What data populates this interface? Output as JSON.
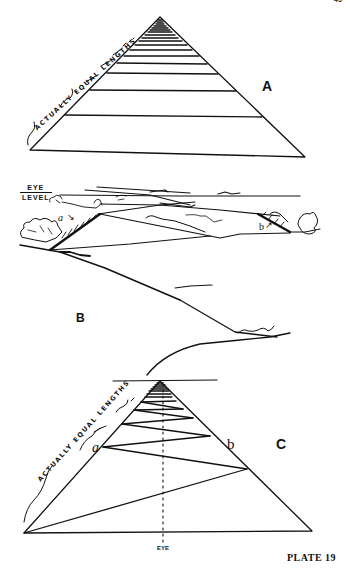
{
  "page": {
    "page_number": "43",
    "caption": "PLATE 19"
  },
  "figure_A": {
    "label": "A",
    "annotation": "ACTUALLY EQUAL LENGTHS"
  },
  "figure_B": {
    "label": "B",
    "eye_level_line1": "EYE",
    "eye_level_line2": "LEVEL",
    "point_a": "a",
    "point_b": "b"
  },
  "figure_C": {
    "label": "C",
    "annotation": "ACTUALLY EQUAL LENGTHS",
    "point_a": "a",
    "point_b": "b",
    "eye_marker": "EYE"
  },
  "colors": {
    "ink": "#111111",
    "paper": "#ffffff"
  }
}
